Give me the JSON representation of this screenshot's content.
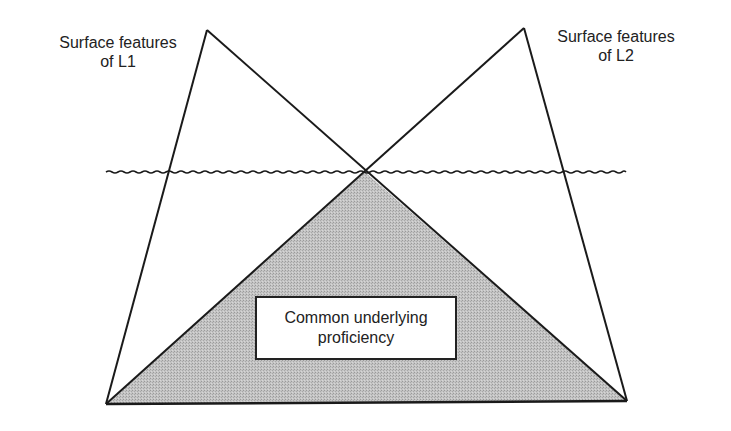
{
  "diagram": {
    "type": "iceberg-dual-triangle",
    "labels": {
      "l1": {
        "line1": "Surface features",
        "line2": "of L1"
      },
      "l2": {
        "line1": "Surface features",
        "line2": "of L2"
      },
      "center": {
        "line1": "Common underlying",
        "line2": "proficiency"
      }
    },
    "colors": {
      "stroke": "#1a1a1a",
      "shaded_fill": "#bdbdbd",
      "background": "#ffffff",
      "box_fill": "#ffffff"
    },
    "geometry": {
      "l1_apex": [
        207,
        30
      ],
      "l2_apex": [
        524,
        28
      ],
      "bottom_left": [
        106,
        404
      ],
      "bottom_right": [
        627,
        401
      ],
      "crossing_point": [
        365,
        172
      ],
      "waterline": {
        "y": 172,
        "x_start": 106,
        "x_end": 626
      }
    }
  }
}
